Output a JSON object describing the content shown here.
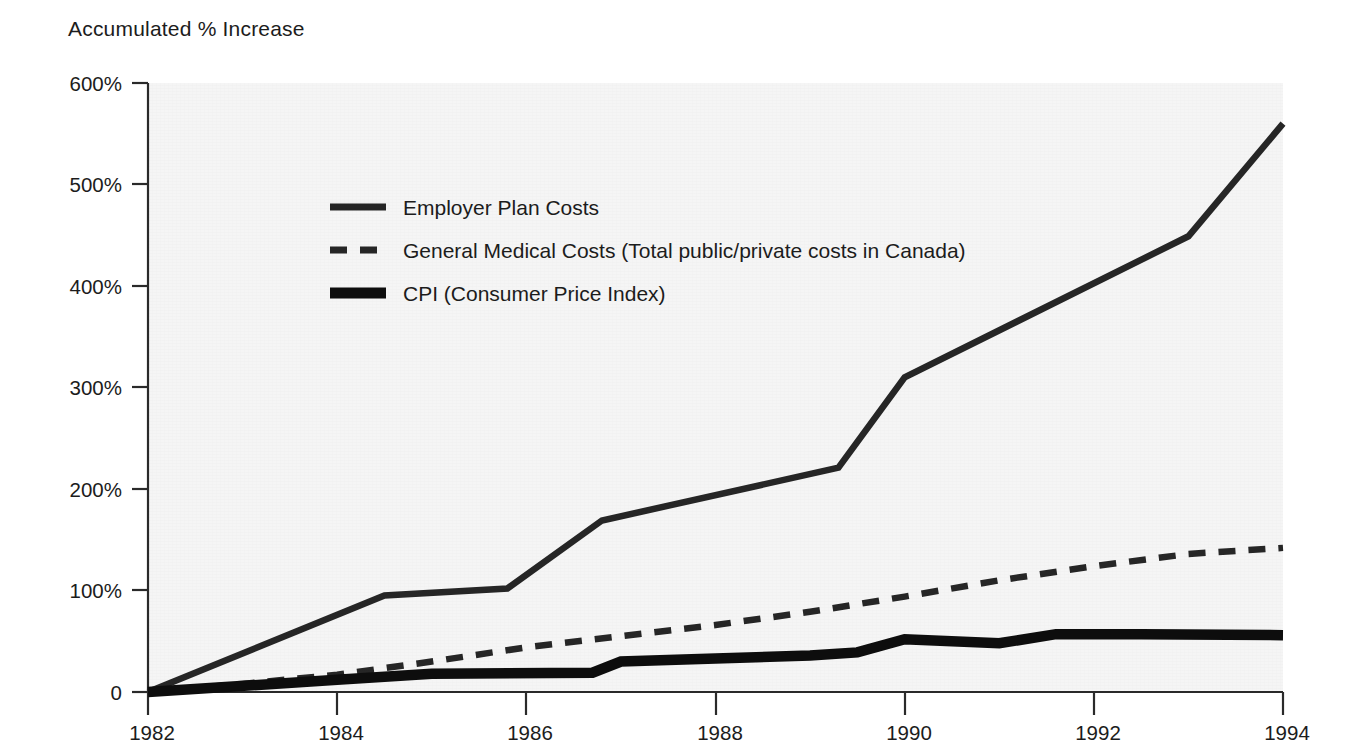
{
  "chart_data": {
    "type": "line",
    "title": "Accumulated % Increase",
    "xlabel": "",
    "ylabel": "Accumulated % Increase",
    "grid": false,
    "legend_position": "inside-upper-left",
    "xlim": [
      1982,
      1994
    ],
    "ylim": [
      0,
      600
    ],
    "x_tick_labels": [
      "1982",
      "1984",
      "1986",
      "1988",
      "1990",
      "1992",
      "1994"
    ],
    "x_ticks": [
      1982,
      1984,
      1986,
      1988,
      1990,
      1992,
      1994
    ],
    "y_tick_labels": [
      "0",
      "100%",
      "200%",
      "300%",
      "400%",
      "500%",
      "600%"
    ],
    "y_ticks": [
      0,
      100,
      200,
      300,
      400,
      500,
      600
    ],
    "series": [
      {
        "name": "Employer Plan Costs",
        "style": "solid",
        "width": "medium",
        "color": "#262626",
        "x": [
          1982,
          1984.5,
          1985.8,
          1986.8,
          1989.3,
          1990,
          1993,
          1994
        ],
        "values": [
          0,
          95,
          102,
          169,
          221,
          310,
          449,
          560
        ]
      },
      {
        "name": "General Medical Costs (Total public/private costs in Canada)",
        "style": "dashed",
        "width": "medium",
        "color": "#262626",
        "x": [
          1982,
          1983,
          1984,
          1985,
          1986,
          1987,
          1988,
          1989,
          1990,
          1991,
          1992,
          1993,
          1994
        ],
        "values": [
          0,
          8,
          17,
          30,
          44,
          55,
          66,
          79,
          94,
          110,
          124,
          136,
          142
        ]
      },
      {
        "name": "CPI (Consumer Price Index)",
        "style": "solid",
        "width": "thick",
        "color": "#0d0d0d",
        "x": [
          1982,
          1984,
          1985,
          1986.7,
          1987,
          1988,
          1989,
          1989.5,
          1990,
          1991,
          1991.6,
          1992.5,
          1994
        ],
        "values": [
          0,
          12,
          18,
          19,
          30,
          33,
          36,
          39,
          52,
          48,
          57,
          57,
          56
        ]
      }
    ]
  },
  "legend": {
    "items": [
      {
        "label": "Employer Plan Costs",
        "swatch": "solid-medium-line-swatch"
      },
      {
        "label": "General Medical Costs (Total public/private costs in Canada)",
        "swatch": "dashed-medium-line-swatch"
      },
      {
        "label": "CPI (Consumer Price Index)",
        "swatch": "solid-thick-line-swatch"
      }
    ]
  },
  "colors": {
    "plot_background": "#f5f5f5",
    "axis": "#2a2a2a",
    "text": "#1c1c1c",
    "employer_series": "#262626",
    "general_series": "#262626",
    "cpi_series": "#0d0d0d"
  }
}
